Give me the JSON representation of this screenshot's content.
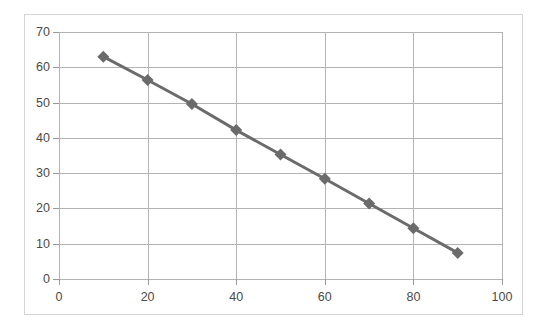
{
  "chart_data": {
    "type": "line",
    "title": "",
    "subtitle": "",
    "xlabel": "",
    "ylabel": "",
    "xlim": [
      0,
      100
    ],
    "ylim": [
      0,
      70
    ],
    "xticks": [
      0,
      20,
      40,
      60,
      80,
      100
    ],
    "yticks": [
      0,
      10,
      20,
      30,
      40,
      50,
      60,
      70
    ],
    "gridlines": {
      "horizontal": true,
      "vertical": true,
      "color": "#b3b3b3"
    },
    "legend": {
      "visible": false,
      "position": "none",
      "entries": []
    },
    "annotations": [],
    "series": [
      {
        "name": "Series 1",
        "marker": "diamond",
        "marker_size": 6,
        "line_color": "#6b6b6b",
        "marker_color": "#6b6b6b",
        "line_width": 3,
        "x": [
          10,
          20,
          30,
          40,
          50,
          60,
          70,
          80,
          90
        ],
        "values": [
          63.0,
          56.4,
          49.6,
          42.2,
          35.3,
          28.4,
          21.4,
          14.4,
          7.4
        ]
      }
    ]
  },
  "axis": {
    "y_tick_labels": [
      "70",
      "60",
      "50",
      "40",
      "30",
      "20",
      "10",
      "0"
    ],
    "x_tick_labels": [
      "0",
      "20",
      "40",
      "60",
      "80",
      "100"
    ]
  },
  "style": {
    "plot_border_color": "#d4d4d4",
    "axis_color": "#9a9a9a",
    "tick_label_color": "#4a4a4a",
    "background": "#ffffff"
  }
}
